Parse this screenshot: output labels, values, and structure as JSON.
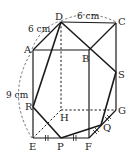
{
  "diagram": {
    "type": "cube-cross-section",
    "vertices": {
      "A": {
        "label": "A",
        "x": 33,
        "y": 50
      },
      "B": {
        "label": "B",
        "x": 89,
        "y": 50
      },
      "C": {
        "label": "C",
        "x": 116,
        "y": 23
      },
      "D": {
        "label": "D",
        "x": 61,
        "y": 22
      },
      "E": {
        "label": "E",
        "x": 33,
        "y": 138
      },
      "F": {
        "label": "F",
        "x": 89,
        "y": 138
      },
      "G": {
        "label": "G",
        "x": 116,
        "y": 110
      },
      "H": {
        "label": "H",
        "x": 61,
        "y": 110
      }
    },
    "points": {
      "P": {
        "label": "P",
        "x": 61,
        "y": 138
      },
      "Q": {
        "label": "Q",
        "x": 101,
        "y": 125
      },
      "R": {
        "label": "R",
        "x": 33,
        "y": 107
      },
      "S": {
        "label": "S",
        "x": 116,
        "y": 72
      }
    },
    "dimensions": {
      "dc": "6 cm",
      "da": "6 cm",
      "ae": "9 cm"
    }
  }
}
